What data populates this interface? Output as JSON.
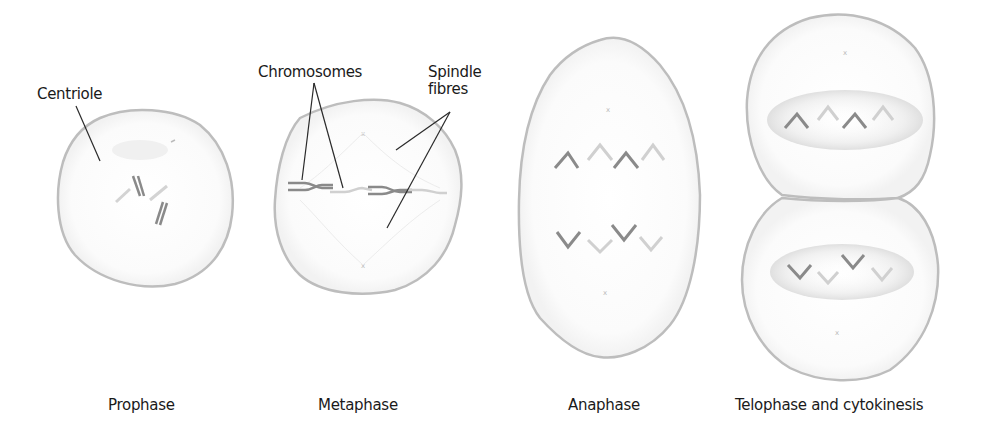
{
  "colors": {
    "membrane": "#b8b8b8",
    "chromosome_dark": "#7a7a7a",
    "chromosome_light": "#cfcfcf",
    "spindle": "#e6e6e6",
    "leader_line": "#2a2a2a",
    "text": "#1a1a1a"
  },
  "annotations": {
    "centriole": "Centriole",
    "chromosomes": "Chromosomes",
    "spindle_line1": "Spindle",
    "spindle_line2": "fibres"
  },
  "stages": [
    {
      "label": "Prophase"
    },
    {
      "label": "Metaphase"
    },
    {
      "label": "Anaphase"
    },
    {
      "label": "Telophase and cytokinesis"
    }
  ]
}
